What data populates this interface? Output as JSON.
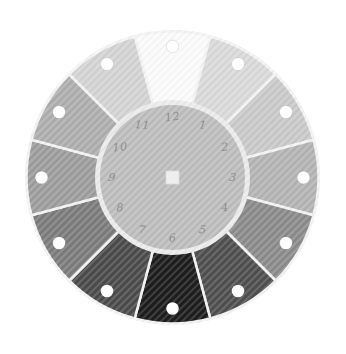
{
  "figure": {
    "name": "grayscale-value-wheel",
    "background_color": "#ffffff",
    "separator_color": "#f3f3f3",
    "rim_color": "#efefef",
    "inner_ring_color": "#ebebeb",
    "inner_disc_color": "#bdbdbd",
    "number_color": "#8d8d8d",
    "hole_color": "#ffffff",
    "hole_outline_color": "#e3e3e3",
    "center_square_color": "#eeeeee",
    "center_square_outline": "#dcdcdc",
    "texture_line_color": "#ffffff",
    "segments": [
      {
        "hour": "12",
        "shade": "#fafafa"
      },
      {
        "hour": "1",
        "shade": "#d9d9d9"
      },
      {
        "hour": "2",
        "shade": "#c9c9c9"
      },
      {
        "hour": "3",
        "shade": "#b4b4b4"
      },
      {
        "hour": "4",
        "shade": "#8b8b8b"
      },
      {
        "hour": "5",
        "shade": "#4f4f4f"
      },
      {
        "hour": "6",
        "shade": "#1d1d1d"
      },
      {
        "hour": "7",
        "shade": "#4b4b4b"
      },
      {
        "hour": "8",
        "shade": "#7c7c7c"
      },
      {
        "hour": "9",
        "shade": "#9d9d9d"
      },
      {
        "hour": "10",
        "shade": "#aeaeae"
      },
      {
        "hour": "11",
        "shade": "#d3d3d3"
      }
    ]
  }
}
